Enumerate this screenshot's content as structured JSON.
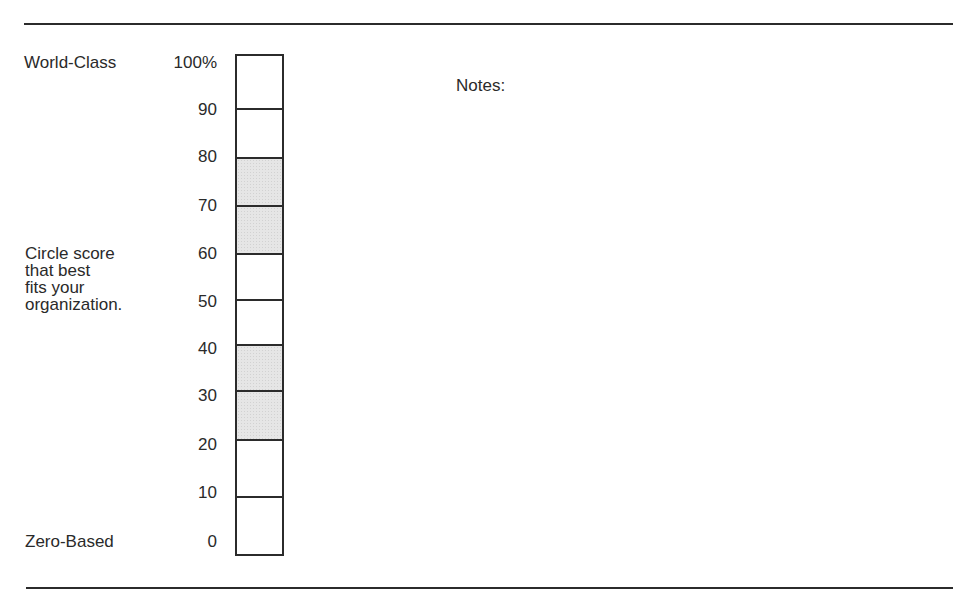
{
  "document": {
    "top_label": "World-Class",
    "bottom_label": "Zero-Based",
    "instruction_lines": [
      "Circle score",
      "that best",
      "fits your",
      "organization."
    ],
    "notes_label": "Notes:"
  },
  "scale": {
    "labels": [
      "100%",
      "90",
      "80",
      "70",
      "60",
      "50",
      "40",
      "30",
      "20",
      "10",
      "0"
    ],
    "segments": [
      {
        "from": 100,
        "to": 90,
        "shaded": false
      },
      {
        "from": 90,
        "to": 80,
        "shaded": false
      },
      {
        "from": 80,
        "to": 70,
        "shaded": true
      },
      {
        "from": 70,
        "to": 60,
        "shaded": true
      },
      {
        "from": 60,
        "to": 50,
        "shaded": false
      },
      {
        "from": 50,
        "to": 40,
        "shaded": false
      },
      {
        "from": 40,
        "to": 30,
        "shaded": true
      },
      {
        "from": 30,
        "to": 20,
        "shaded": true
      },
      {
        "from": 20,
        "to": 10,
        "shaded": false
      },
      {
        "from": 10,
        "to": 0,
        "shaded": false
      }
    ],
    "shade_color": "#e6e6e6",
    "line_color": "#2b2b2b"
  }
}
